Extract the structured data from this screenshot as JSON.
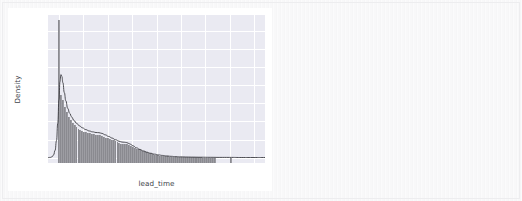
{
  "page": {
    "background_color": "#f8f8f9",
    "figure_background": "#ffffff"
  },
  "figure": {
    "axes_facecolor": "#eaeaf2",
    "grid_color": "#ffffff",
    "bar_color": "#9d9da3",
    "kde_line_color": "#3c3c42",
    "tick_color": "#555a63"
  },
  "chart_data": {
    "type": "histogram",
    "title": "",
    "xlabel": "lead_time",
    "ylabel": "Density",
    "xlim": [
      -45,
      845
    ],
    "ylim": [
      -0.0006,
      0.0158
    ],
    "grid": true,
    "legend": null,
    "xticks": [
      0,
      100,
      200,
      300,
      400,
      500,
      600,
      700,
      800
    ],
    "xtick_labels": [
      "0",
      "100",
      "200",
      "300",
      "400",
      "500",
      "600",
      "700",
      "800"
    ],
    "yticks": [
      0.0,
      0.002,
      0.004,
      0.006,
      0.008,
      0.01,
      0.012,
      0.014
    ],
    "ytick_labels": [
      "0.000",
      "0.002",
      "0.004",
      "0.006",
      "0.008",
      "0.010",
      "0.012",
      "0.014"
    ],
    "bin_width": 8,
    "bins": [
      {
        "x0": -4,
        "density": 0.01525
      },
      {
        "x0": 4,
        "density": 0.00695
      },
      {
        "x0": 12,
        "density": 0.0064
      },
      {
        "x0": 20,
        "density": 0.0056
      },
      {
        "x0": 28,
        "density": 0.00505
      },
      {
        "x0": 36,
        "density": 0.00455
      },
      {
        "x0": 44,
        "density": 0.0042
      },
      {
        "x0": 52,
        "density": 0.00385
      },
      {
        "x0": 60,
        "density": 0.0036
      },
      {
        "x0": 68,
        "density": 0.0034
      },
      {
        "x0": 76,
        "density": 0.0032
      },
      {
        "x0": 84,
        "density": 0.00305
      },
      {
        "x0": 92,
        "density": 0.00295
      },
      {
        "x0": 100,
        "density": 0.00285
      },
      {
        "x0": 108,
        "density": 0.0028
      },
      {
        "x0": 116,
        "density": 0.00272
      },
      {
        "x0": 124,
        "density": 0.00268
      },
      {
        "x0": 132,
        "density": 0.00262
      },
      {
        "x0": 140,
        "density": 0.00258
      },
      {
        "x0": 148,
        "density": 0.00252
      },
      {
        "x0": 156,
        "density": 0.00248
      },
      {
        "x0": 164,
        "density": 0.00252
      },
      {
        "x0": 172,
        "density": 0.0024
      },
      {
        "x0": 180,
        "density": 0.0023
      },
      {
        "x0": 188,
        "density": 0.00222
      },
      {
        "x0": 196,
        "density": 0.00214
      },
      {
        "x0": 204,
        "density": 0.00205
      },
      {
        "x0": 212,
        "density": 0.00198
      },
      {
        "x0": 220,
        "density": 0.0019
      },
      {
        "x0": 228,
        "density": 0.00182
      },
      {
        "x0": 236,
        "density": 0.00172
      },
      {
        "x0": 244,
        "density": 0.0016
      },
      {
        "x0": 252,
        "density": 0.00152
      },
      {
        "x0": 260,
        "density": 0.00148
      },
      {
        "x0": 268,
        "density": 0.00152
      },
      {
        "x0": 276,
        "density": 0.00148
      },
      {
        "x0": 284,
        "density": 0.0014
      },
      {
        "x0": 292,
        "density": 0.00128
      },
      {
        "x0": 300,
        "density": 0.00118
      },
      {
        "x0": 308,
        "density": 0.0011
      },
      {
        "x0": 316,
        "density": 0.001
      },
      {
        "x0": 324,
        "density": 0.00092
      },
      {
        "x0": 332,
        "density": 0.00085
      },
      {
        "x0": 340,
        "density": 0.00076
      },
      {
        "x0": 348,
        "density": 0.00068
      },
      {
        "x0": 356,
        "density": 0.0006
      },
      {
        "x0": 364,
        "density": 0.00052
      },
      {
        "x0": 372,
        "density": 0.00046
      },
      {
        "x0": 380,
        "density": 0.0004
      },
      {
        "x0": 388,
        "density": 0.00034
      },
      {
        "x0": 396,
        "density": 0.0003
      },
      {
        "x0": 404,
        "density": 0.00026
      },
      {
        "x0": 412,
        "density": 0.00023
      },
      {
        "x0": 420,
        "density": 0.0002
      },
      {
        "x0": 428,
        "density": 0.00017
      },
      {
        "x0": 436,
        "density": 0.00015
      },
      {
        "x0": 444,
        "density": 0.00013
      },
      {
        "x0": 452,
        "density": 0.00011
      },
      {
        "x0": 460,
        "density": 0.0001
      },
      {
        "x0": 468,
        "density": 9e-05
      },
      {
        "x0": 476,
        "density": 8e-05
      },
      {
        "x0": 484,
        "density": 7e-05
      },
      {
        "x0": 492,
        "density": 6e-05
      },
      {
        "x0": 500,
        "density": 5e-05
      },
      {
        "x0": 508,
        "density": 5e-05
      },
      {
        "x0": 516,
        "density": 4e-05
      },
      {
        "x0": 524,
        "density": 4e-05
      },
      {
        "x0": 532,
        "density": 3e-05
      },
      {
        "x0": 540,
        "density": 3e-05
      },
      {
        "x0": 548,
        "density": 3e-05
      },
      {
        "x0": 556,
        "density": 2e-05
      },
      {
        "x0": 564,
        "density": 2e-05
      },
      {
        "x0": 572,
        "density": 2e-05
      },
      {
        "x0": 580,
        "density": 2e-05
      },
      {
        "x0": 588,
        "density": 1e-05
      },
      {
        "x0": 596,
        "density": 1e-05
      },
      {
        "x0": 604,
        "density": 1e-05
      },
      {
        "x0": 612,
        "density": 1e-05
      },
      {
        "x0": 620,
        "density": 1e-05
      },
      {
        "x0": 628,
        "density": 1e-05
      },
      {
        "x0": 636,
        "density": 1e-05
      },
      {
        "x0": 700,
        "density": 1e-05
      }
    ],
    "kde_curve": [
      {
        "x": -45,
        "y": 0.0
      },
      {
        "x": -35,
        "y": 2e-05
      },
      {
        "x": -28,
        "y": 0.0001
      },
      {
        "x": -22,
        "y": 0.0003
      },
      {
        "x": -16,
        "y": 0.0008
      },
      {
        "x": -10,
        "y": 0.0019
      },
      {
        "x": -5,
        "y": 0.0038
      },
      {
        "x": 0,
        "y": 0.0064
      },
      {
        "x": 4,
        "y": 0.0084
      },
      {
        "x": 8,
        "y": 0.0092
      },
      {
        "x": 12,
        "y": 0.009
      },
      {
        "x": 16,
        "y": 0.0083
      },
      {
        "x": 22,
        "y": 0.0072
      },
      {
        "x": 28,
        "y": 0.0063
      },
      {
        "x": 36,
        "y": 0.00545
      },
      {
        "x": 44,
        "y": 0.0049
      },
      {
        "x": 52,
        "y": 0.0045
      },
      {
        "x": 62,
        "y": 0.0041
      },
      {
        "x": 72,
        "y": 0.0038
      },
      {
        "x": 84,
        "y": 0.00352
      },
      {
        "x": 96,
        "y": 0.0033
      },
      {
        "x": 110,
        "y": 0.0031
      },
      {
        "x": 124,
        "y": 0.00295
      },
      {
        "x": 138,
        "y": 0.00285
      },
      {
        "x": 152,
        "y": 0.00278
      },
      {
        "x": 164,
        "y": 0.00276
      },
      {
        "x": 176,
        "y": 0.00268
      },
      {
        "x": 190,
        "y": 0.00252
      },
      {
        "x": 204,
        "y": 0.00234
      },
      {
        "x": 218,
        "y": 0.00216
      },
      {
        "x": 232,
        "y": 0.00198
      },
      {
        "x": 246,
        "y": 0.00182
      },
      {
        "x": 258,
        "y": 0.00172
      },
      {
        "x": 268,
        "y": 0.0017
      },
      {
        "x": 278,
        "y": 0.00166
      },
      {
        "x": 290,
        "y": 0.00152
      },
      {
        "x": 304,
        "y": 0.0013
      },
      {
        "x": 318,
        "y": 0.00108
      },
      {
        "x": 332,
        "y": 0.0009
      },
      {
        "x": 346,
        "y": 0.00074
      },
      {
        "x": 360,
        "y": 0.0006
      },
      {
        "x": 376,
        "y": 0.00048
      },
      {
        "x": 392,
        "y": 0.00038
      },
      {
        "x": 408,
        "y": 0.0003
      },
      {
        "x": 424,
        "y": 0.00024
      },
      {
        "x": 442,
        "y": 0.00018
      },
      {
        "x": 460,
        "y": 0.00014
      },
      {
        "x": 480,
        "y": 0.0001
      },
      {
        "x": 500,
        "y": 8e-05
      },
      {
        "x": 525,
        "y": 6e-05
      },
      {
        "x": 550,
        "y": 5e-05
      },
      {
        "x": 580,
        "y": 4e-05
      },
      {
        "x": 620,
        "y": 3e-05
      },
      {
        "x": 660,
        "y": 2e-05
      },
      {
        "x": 700,
        "y": 2e-05
      },
      {
        "x": 750,
        "y": 1e-05
      },
      {
        "x": 800,
        "y": 1e-05
      },
      {
        "x": 845,
        "y": 1e-05
      }
    ]
  }
}
